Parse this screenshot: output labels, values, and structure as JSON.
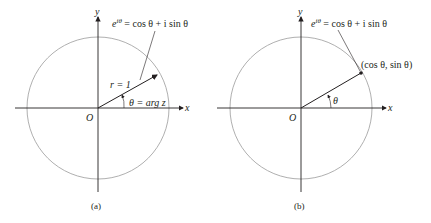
{
  "figure": {
    "panels": [
      {
        "id": "a",
        "caption": "(a)",
        "axis_x": "x",
        "axis_y": "y",
        "origin": "O",
        "formula": {
          "base": "e",
          "exp": "iθ",
          "rest": " = cos θ + i sin θ"
        },
        "radius_label": "r = 1",
        "angle_label": "θ = arg z"
      },
      {
        "id": "b",
        "caption": "(b)",
        "axis_x": "x",
        "axis_y": "y",
        "origin": "O",
        "formula": {
          "base": "e",
          "exp": "iθ",
          "rest": " = cos θ + i sin θ"
        },
        "point_label": "(cos θ, sin θ)",
        "angle_label": "θ"
      }
    ],
    "colors": {
      "ink": "#231f20",
      "circle": "#9a9a9a"
    }
  }
}
